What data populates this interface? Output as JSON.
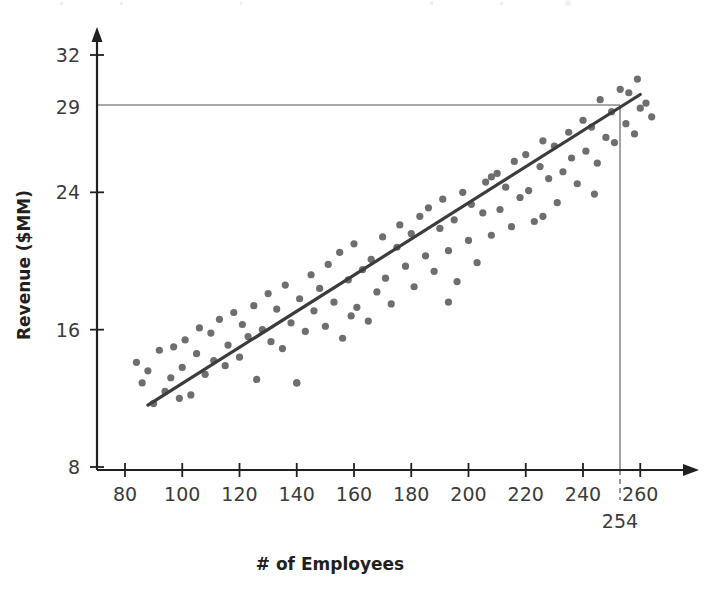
{
  "chart_data": {
    "type": "scatter",
    "title": "",
    "xlabel": "# of Employees",
    "ylabel": "Revenue ($MM)",
    "xlim": [
      68,
      272
    ],
    "ylim": [
      8,
      33.2
    ],
    "xticks": [
      80,
      100,
      120,
      140,
      160,
      180,
      200,
      220,
      240,
      260
    ],
    "yticks": [
      8,
      16,
      24,
      29,
      32
    ],
    "xtick_labels": [
      "80",
      "100",
      "120",
      "140",
      "160",
      "180",
      "200",
      "220",
      "240",
      "260"
    ],
    "ytick_labels": [
      "8",
      "16",
      "24",
      "29",
      "32"
    ],
    "grid": false,
    "legend": null,
    "point_color": "#6e6e6e",
    "line_color": "#3c3c3c",
    "annotation_color": "#8c8c8c",
    "axis_color": "#231f20",
    "trendline": {
      "name": "linear fit",
      "x_start": 88,
      "y_start": 11.6,
      "x_end": 260,
      "y_end": 29.7,
      "slope": 0.1052,
      "intercept": 2.34
    },
    "annotations": [
      {
        "name": "revenue-guide",
        "type": "horizontal-line",
        "y": 29,
        "x_from": 68,
        "x_to": 254,
        "label": "29"
      },
      {
        "name": "employee-guide",
        "type": "vertical-line",
        "x": 254,
        "y_from": 8,
        "y_to": 29,
        "label": "254"
      },
      {
        "name": "employee-guide-extension",
        "type": "vertical-dashed-line",
        "x": 254,
        "label": "254"
      }
    ],
    "points": [
      [
        84,
        14.1
      ],
      [
        86,
        12.9
      ],
      [
        88,
        13.6
      ],
      [
        90,
        11.7
      ],
      [
        92,
        14.8
      ],
      [
        94,
        12.4
      ],
      [
        96,
        13.2
      ],
      [
        97,
        15.0
      ],
      [
        99,
        12.0
      ],
      [
        100,
        13.8
      ],
      [
        101,
        15.4
      ],
      [
        103,
        12.2
      ],
      [
        105,
        14.6
      ],
      [
        106,
        16.1
      ],
      [
        108,
        13.4
      ],
      [
        110,
        15.8
      ],
      [
        111,
        14.2
      ],
      [
        113,
        16.6
      ],
      [
        115,
        13.9
      ],
      [
        116,
        15.1
      ],
      [
        118,
        17.0
      ],
      [
        120,
        14.4
      ],
      [
        121,
        16.3
      ],
      [
        123,
        15.6
      ],
      [
        125,
        17.4
      ],
      [
        126,
        13.1
      ],
      [
        128,
        16.0
      ],
      [
        130,
        18.1
      ],
      [
        131,
        15.3
      ],
      [
        133,
        17.2
      ],
      [
        135,
        14.9
      ],
      [
        136,
        18.6
      ],
      [
        138,
        16.4
      ],
      [
        140,
        12.9
      ],
      [
        141,
        17.8
      ],
      [
        143,
        15.9
      ],
      [
        145,
        19.2
      ],
      [
        146,
        17.1
      ],
      [
        148,
        18.4
      ],
      [
        150,
        16.2
      ],
      [
        151,
        19.8
      ],
      [
        153,
        17.6
      ],
      [
        155,
        20.5
      ],
      [
        156,
        15.5
      ],
      [
        158,
        18.9
      ],
      [
        159,
        16.8
      ],
      [
        160,
        21.0
      ],
      [
        161,
        17.3
      ],
      [
        163,
        19.5
      ],
      [
        165,
        16.5
      ],
      [
        166,
        20.1
      ],
      [
        168,
        18.2
      ],
      [
        170,
        21.4
      ],
      [
        171,
        19.0
      ],
      [
        173,
        17.5
      ],
      [
        175,
        20.8
      ],
      [
        176,
        22.1
      ],
      [
        178,
        19.7
      ],
      [
        180,
        21.6
      ],
      [
        181,
        18.5
      ],
      [
        183,
        22.6
      ],
      [
        185,
        20.3
      ],
      [
        186,
        23.1
      ],
      [
        188,
        19.4
      ],
      [
        190,
        21.9
      ],
      [
        191,
        23.6
      ],
      [
        193,
        20.6
      ],
      [
        195,
        22.4
      ],
      [
        196,
        18.8
      ],
      [
        198,
        24.0
      ],
      [
        200,
        21.2
      ],
      [
        201,
        23.3
      ],
      [
        203,
        19.9
      ],
      [
        205,
        22.8
      ],
      [
        206,
        24.6
      ],
      [
        208,
        21.5
      ],
      [
        210,
        25.1
      ],
      [
        211,
        23.0
      ],
      [
        213,
        24.3
      ],
      [
        215,
        22.0
      ],
      [
        216,
        25.8
      ],
      [
        218,
        23.7
      ],
      [
        220,
        26.2
      ],
      [
        221,
        24.1
      ],
      [
        223,
        22.3
      ],
      [
        225,
        25.5
      ],
      [
        226,
        27.0
      ],
      [
        228,
        24.8
      ],
      [
        230,
        26.7
      ],
      [
        231,
        23.4
      ],
      [
        233,
        25.2
      ],
      [
        235,
        27.5
      ],
      [
        236,
        26.0
      ],
      [
        238,
        24.5
      ],
      [
        240,
        28.2
      ],
      [
        241,
        26.4
      ],
      [
        243,
        27.8
      ],
      [
        245,
        25.7
      ],
      [
        246,
        29.4
      ],
      [
        248,
        27.2
      ],
      [
        250,
        28.7
      ],
      [
        251,
        26.9
      ],
      [
        253,
        30.0
      ],
      [
        255,
        28.0
      ],
      [
        256,
        29.8
      ],
      [
        258,
        27.4
      ],
      [
        259,
        30.6
      ],
      [
        260,
        28.9
      ],
      [
        262,
        29.2
      ],
      [
        264,
        28.4
      ],
      [
        140,
        12.9
      ],
      [
        193,
        17.6
      ],
      [
        208,
        24.9
      ],
      [
        226,
        22.6
      ],
      [
        244,
        23.9
      ]
    ]
  }
}
